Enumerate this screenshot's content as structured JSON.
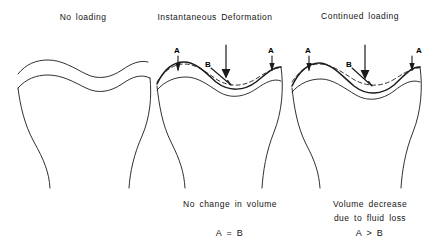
{
  "figure": {
    "background_color": "#ffffff",
    "line_color": "#1a1a1a"
  },
  "headings": {
    "no_loading": "No loading",
    "instantaneous_deformation": "Instantaneous  Deformation",
    "continued_loading": "Continued  loading"
  },
  "captions": {
    "middle_line1": "No  change  in  volume",
    "right_line1": "Volume  decrease",
    "right_line2": "due  to  fluid  loss"
  },
  "relations": {
    "middle": "A = B",
    "right": "A > B"
  },
  "annotations": {
    "a_label": "A",
    "b_label": "B",
    "middle_a_left": "A",
    "middle_b": "B",
    "middle_a_right": "A",
    "right_a_left": "A",
    "right_b": "B",
    "right_a_right": "A"
  },
  "panels": [
    {
      "id": "panel-no-loading",
      "heading": "No loading",
      "has_load_arrow": false,
      "has_dashed_outline": false,
      "caption": "",
      "relation": ""
    },
    {
      "id": "panel-instantaneous-deformation",
      "heading": "Instantaneous  Deformation",
      "has_load_arrow": true,
      "has_dashed_outline": true,
      "caption": "No  change  in  volume",
      "relation": "A = B"
    },
    {
      "id": "panel-continued-loading",
      "heading": "Continued  loading",
      "has_load_arrow": true,
      "has_dashed_outline": true,
      "caption": "Volume  decrease  due  to  fluid  loss",
      "relation": "A > B"
    }
  ]
}
